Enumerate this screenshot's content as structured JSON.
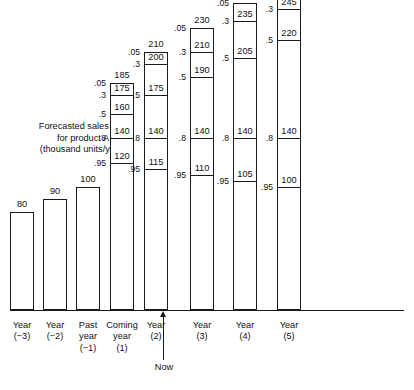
{
  "chart_data": {
    "type": "bar",
    "title": "Forecasted sales rate for product A (thousand units/year)",
    "title_lines": [
      "Forecasted sales rate",
      "for product A",
      "(thousand units/year)"
    ],
    "xlabel": "",
    "ylabel": "thousand units/year",
    "ylim": [
      0,
      280
    ],
    "grid": false,
    "legend": null,
    "annotations": [
      {
        "name": "now-marker",
        "label": "Now",
        "position": "between Past year (-1) and Coming year (1)"
      }
    ],
    "fractile_levels": [
      ".05",
      ".3",
      ".5",
      ".8",
      ".95"
    ],
    "categories": [
      "Year (-3)",
      "Year (-2)",
      "Past year (-1)",
      "Coming year (1)",
      "Year (2)",
      "Year (3)",
      "Year (4)",
      "Year (5)"
    ],
    "category_lines": [
      [
        "Year",
        "(−3)"
      ],
      [
        "Year",
        "(−2)"
      ],
      [
        "Past",
        "year",
        "(−1)"
      ],
      [
        "Coming",
        "year",
        "(1)"
      ],
      [
        "Year",
        "(2)"
      ],
      [
        "Year",
        "(3)"
      ],
      [
        "Year",
        "(4)"
      ],
      [
        "Year",
        "(5)"
      ]
    ],
    "bars": [
      {
        "category": "Year (-3)",
        "kind": "historical",
        "value": 80,
        "top_label": "80"
      },
      {
        "category": "Year (-2)",
        "kind": "historical",
        "value": 90,
        "top_label": "90"
      },
      {
        "category": "Past year (-1)",
        "kind": "historical",
        "value": 100,
        "top_label": "100"
      },
      {
        "category": "Coming year (1)",
        "kind": "forecast",
        "top_label": "185",
        "fractiles": [
          {
            "p": ".05",
            "value": 185
          },
          {
            "p": ".3",
            "value": 175
          },
          {
            "p": ".5",
            "value": 160
          },
          {
            "p": ".8",
            "value": 140
          },
          {
            "p": ".95",
            "value": 120
          }
        ]
      },
      {
        "category": "Year (2)",
        "kind": "forecast",
        "top_label": "210",
        "fractiles": [
          {
            "p": ".05",
            "value": 210
          },
          {
            "p": ".3",
            "value": 200
          },
          {
            "p": ".5",
            "value": 175
          },
          {
            "p": ".8",
            "value": 140
          },
          {
            "p": ".95",
            "value": 115
          }
        ]
      },
      {
        "category": "Year (3)",
        "kind": "forecast",
        "top_label": "230",
        "fractiles": [
          {
            "p": ".05",
            "value": 230
          },
          {
            "p": ".3",
            "value": 210
          },
          {
            "p": ".5",
            "value": 190
          },
          {
            "p": ".8",
            "value": 140
          },
          {
            "p": ".95",
            "value": 110
          }
        ]
      },
      {
        "category": "Year (4)",
        "kind": "forecast",
        "top_label": "250",
        "fractiles": [
          {
            "p": ".05",
            "value": 250
          },
          {
            "p": ".3",
            "value": 235
          },
          {
            "p": ".5",
            "value": 205
          },
          {
            "p": ".8",
            "value": 140
          },
          {
            "p": ".95",
            "value": 105
          }
        ]
      },
      {
        "category": "Year (5)",
        "kind": "forecast",
        "top_label": "270",
        "fractiles": [
          {
            "p": ".05",
            "value": 270
          },
          {
            "p": ".3",
            "value": 245
          },
          {
            "p": ".5",
            "value": 220
          },
          {
            "p": ".8",
            "value": 140
          },
          {
            "p": ".95",
            "value": 100
          }
        ]
      }
    ]
  },
  "colors": {
    "ink": "#1a1a1a",
    "background": "#ffffff",
    "text": "#111111"
  },
  "layout": {
    "baseline_y": 310,
    "px_per_unit": 1.228,
    "bar_x": [
      10,
      43,
      76,
      110,
      144,
      190,
      233,
      277,
      320,
      364
    ],
    "bar_width": 24
  }
}
